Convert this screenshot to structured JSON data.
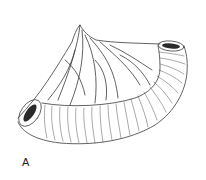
{
  "figure": {
    "style": "line-drawing",
    "panel_label": "A",
    "colors": {
      "background": "#ffffff",
      "line": "#3a3a3a",
      "lumen": "#2a2a2a"
    }
  }
}
